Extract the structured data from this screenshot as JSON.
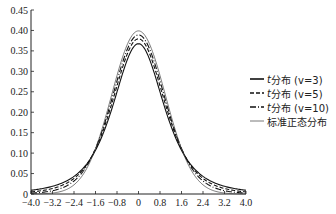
{
  "chart_data": {
    "type": "line",
    "title": "",
    "xlabel": "",
    "ylabel": "",
    "xlim": [
      -4.0,
      4.0
    ],
    "ylim": [
      0,
      0.45
    ],
    "grid": false,
    "legend_position": "right",
    "x_ticks": [
      "-4.0",
      "-3.2",
      "-2.4",
      "-1.6",
      "-0.8",
      "0",
      "0.8",
      "1.6",
      "2.4",
      "3.2",
      "4.0"
    ],
    "y_ticks": [
      "0",
      "0.05",
      "0.10",
      "0.15",
      "0.20",
      "0.25",
      "0.30",
      "0.35",
      "0.40",
      "0.45"
    ],
    "x": [
      -4.0,
      -3.2,
      -2.4,
      -1.6,
      -0.8,
      0,
      0.8,
      1.6,
      2.4,
      3.2,
      4.0
    ],
    "series": [
      {
        "name": "t分布 (v=3)",
        "style": "solid",
        "values": [
          0.0092,
          0.02,
          0.047,
          0.108,
          0.253,
          0.3676,
          0.253,
          0.108,
          0.047,
          0.02,
          0.0092
        ]
      },
      {
        "name": "t分布 (v=5)",
        "style": "dashed",
        "values": [
          0.0051,
          0.014,
          0.04,
          0.107,
          0.276,
          0.3796,
          0.276,
          0.107,
          0.04,
          0.014,
          0.0051
        ]
      },
      {
        "name": "t分布 (v=10)",
        "style": "dashdot",
        "values": [
          0.002,
          0.008,
          0.032,
          0.107,
          0.283,
          0.3891,
          0.283,
          0.107,
          0.032,
          0.008,
          0.002
        ]
      },
      {
        "name": "标准正态分布",
        "style": "thin-solid",
        "values": [
          0.0001,
          0.0024,
          0.0224,
          0.1109,
          0.2897,
          0.3989,
          0.2897,
          0.1109,
          0.0224,
          0.0024,
          0.0001
        ]
      }
    ]
  },
  "legend": {
    "items": [
      {
        "prefix": "t",
        "label": "分布 (v=3)"
      },
      {
        "prefix": "t",
        "label": "分布 (v=5)"
      },
      {
        "prefix": "t",
        "label": "分布 (v=10)"
      },
      {
        "prefix": "",
        "label": "标准正态分布"
      }
    ]
  }
}
